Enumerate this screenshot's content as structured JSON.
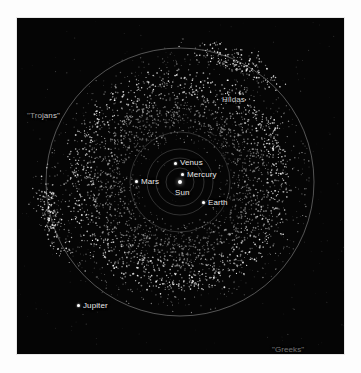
{
  "chart_data": {
    "type": "scatter",
    "title": "",
    "subtitle": "",
    "xlabel": "",
    "ylabel": "",
    "grid": false,
    "legend_position": "none",
    "background_color": "#050505",
    "point_color": "#ffffff",
    "orbit_color": "#8c8c8c",
    "center": {
      "x": 163,
      "y": 164
    },
    "orbits": [
      {
        "name": "Mercury",
        "radius_px": 14,
        "radius_au": 0.39
      },
      {
        "name": "Venus",
        "radius_px": 24,
        "radius_au": 0.72
      },
      {
        "name": "Earth",
        "radius_px": 33,
        "radius_au": 1.0
      },
      {
        "name": "Mars",
        "radius_px": 50,
        "radius_au": 1.52
      },
      {
        "name": "Jupiter",
        "radius_px": 134,
        "radius_au": 5.2
      }
    ],
    "bodies": [
      {
        "label": "Sun",
        "x": 166,
        "y": 168,
        "marker_x": 163,
        "marker_y": 164,
        "marker": true,
        "label_dx": -5,
        "label_dy": 6
      },
      {
        "label": "Mercury",
        "x": 170,
        "y": 156,
        "marker": true
      },
      {
        "label": "Venus",
        "x": 163,
        "y": 145,
        "marker": true
      },
      {
        "label": "Earth",
        "x": 190,
        "y": 184,
        "marker": true
      },
      {
        "label": "Mars",
        "x": 124,
        "y": 163,
        "marker": true
      },
      {
        "label": "Jupiter",
        "x": 65,
        "y": 287,
        "marker": true
      }
    ],
    "annotations": [
      {
        "label": "\"Trojans\"",
        "x": 12,
        "y": 97
      },
      {
        "label": "\"Greeks\"",
        "x": 256,
        "y": 330
      },
      {
        "label": "Hildas",
        "x": 212,
        "y": 81
      }
    ],
    "populations": [
      {
        "name": "main-belt",
        "count": 2400,
        "inner_radius_px": 58,
        "outer_radius_px": 112
      },
      {
        "name": "hildas",
        "count": 130,
        "radius_px": 105
      },
      {
        "name": "trojans",
        "count": 190,
        "angle_deg": 165,
        "radius_px": 134
      },
      {
        "name": "greeks",
        "count": 190,
        "angle_deg": -65,
        "radius_px": 134
      },
      {
        "name": "scatter-halo",
        "count": 260
      }
    ]
  },
  "figure": {
    "border_color": "#e8e8e8",
    "canvas_color": "#ffffff"
  }
}
